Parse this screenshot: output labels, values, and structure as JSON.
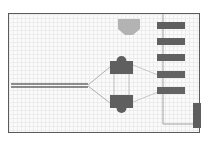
{
  "diagram": {
    "type": "schematic",
    "colors": {
      "frame": "#5a5a5a",
      "node_dark": "#5f5f5f",
      "node_light": "#b3b3b3",
      "bar": "#606060",
      "line": "#8a8a8a",
      "dashed_line": "#c8c8c8",
      "grid": "#ececec",
      "background": "#fbfbfb"
    },
    "elements": {
      "input_line": {
        "label": ""
      },
      "top_shape": {
        "label": ""
      },
      "node_top": {
        "label": ""
      },
      "node_bottom": {
        "label": ""
      },
      "bars": [
        {
          "label": ""
        },
        {
          "label": ""
        },
        {
          "label": ""
        },
        {
          "label": ""
        },
        {
          "label": ""
        }
      ],
      "tall_bar": {
        "label": ""
      }
    }
  }
}
